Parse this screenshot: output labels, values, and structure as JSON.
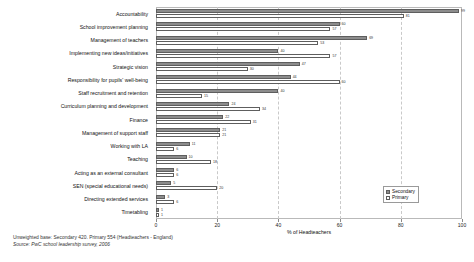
{
  "chart_data": {
    "type": "bar",
    "orientation": "horizontal",
    "title": "",
    "xlabel": "% of Headteachers",
    "ylabel": "",
    "xlim": [
      0,
      100
    ],
    "xticks": [
      0,
      20,
      40,
      60,
      80,
      100
    ],
    "grid": "vertical-dashed",
    "legend_position": "bottom-right",
    "categories": [
      "Accountability",
      "School improvement planning",
      "Management of teachers",
      "Implementing new ideas/initiatives",
      "Strategic vision",
      "Responsibility for pupils' well-being",
      "Staff recruitment and retention",
      "Curriculum planning and development",
      "Finance",
      "Management of support staff",
      "Working with LA",
      "Teaching",
      "Acting as an external consultant",
      "SEN (special educational needs)",
      "Directing extended services",
      "Timetabling"
    ],
    "series": [
      {
        "name": "Secondary",
        "color": "#8c8c8c",
        "values": [
          99,
          60,
          69,
          40,
          47,
          44,
          40,
          24,
          22,
          21,
          11,
          10,
          6,
          5,
          3,
          1
        ]
      },
      {
        "name": "Primary",
        "color": "#ffffff",
        "values": [
          81,
          57,
          53,
          57,
          30,
          60,
          15,
          34,
          31,
          21,
          6,
          18,
          6,
          20,
          6,
          1
        ]
      }
    ]
  },
  "legend": {
    "items": [
      {
        "label": "Secondary",
        "key": "secondary"
      },
      {
        "label": "Primary",
        "key": "primary"
      }
    ]
  },
  "footer": {
    "base": "Unweighted base: Secondary 420. Primary  554 (Headteachers - England)",
    "source": "Source: PwC school leadership survey, 2006"
  }
}
